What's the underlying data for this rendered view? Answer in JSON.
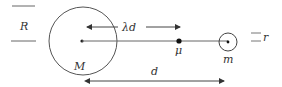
{
  "diagram": {
    "labels": {
      "R": "R",
      "M": "M",
      "lambda_d": "λd",
      "mu": "μ",
      "m": "m",
      "r": "r",
      "d": "d"
    },
    "colors": {
      "stroke": "#444444",
      "text": "#333333",
      "background": "#ffffff"
    },
    "elements": {
      "large_body": {
        "cx": 83,
        "cy": 41,
        "r": 34
      },
      "small_body": {
        "cx": 228,
        "cy": 42,
        "r": 9
      },
      "mu_point": {
        "cx": 179,
        "cy": 41
      }
    }
  }
}
